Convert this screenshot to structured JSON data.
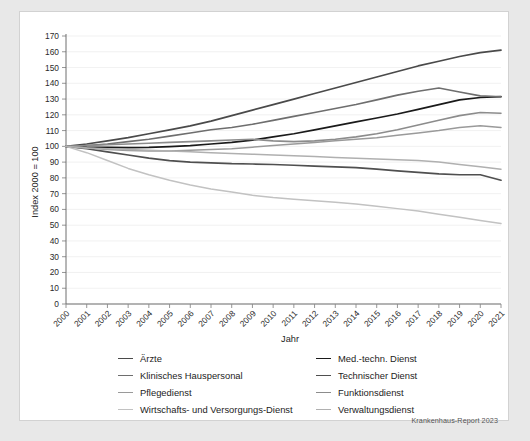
{
  "figure": {
    "credit": "Krankenhaus-Report 2023"
  },
  "chart_data": {
    "type": "line",
    "title": "",
    "xlabel": "Jahr",
    "ylabel": "Index 2000 = 100",
    "xlim": [
      2000,
      2021
    ],
    "ylim": [
      0,
      170
    ],
    "ytick_step": 10,
    "grid": true,
    "legend_position": "bottom",
    "x": [
      2000,
      2001,
      2002,
      2003,
      2004,
      2005,
      2006,
      2007,
      2008,
      2009,
      2010,
      2011,
      2012,
      2013,
      2014,
      2015,
      2016,
      2017,
      2018,
      2019,
      2020,
      2021
    ],
    "xticklabels": [
      "2000",
      "2001",
      "2002",
      "2003",
      "2004",
      "2005",
      "2006",
      "2007",
      "2008",
      "2009",
      "2010",
      "2011",
      "2012",
      "2013",
      "2014",
      "2015",
      "2016",
      "2017",
      "2018",
      "2019",
      "2020",
      "2021"
    ],
    "yticklabels": [
      "0",
      "10",
      "20",
      "30",
      "40",
      "50",
      "60",
      "70",
      "80",
      "90",
      "100",
      "110",
      "120",
      "130",
      "140",
      "150",
      "160",
      "170"
    ],
    "series": [
      {
        "name": "Ärzte",
        "color": "#4a4a4a",
        "width": 1.7,
        "values": [
          100,
          101.5,
          103.5,
          105.5,
          108,
          110.5,
          113,
          116,
          119.5,
          123,
          126.5,
          130,
          133.5,
          137,
          140.5,
          144,
          147.5,
          151,
          154,
          157,
          159.5,
          161
        ]
      },
      {
        "name": "Med.-techn. Dienst",
        "color": "#1a1a1a",
        "width": 1.7,
        "values": [
          100,
          99.5,
          99.3,
          99.2,
          99.3,
          99.8,
          100.5,
          101.5,
          102.5,
          104,
          106,
          108,
          110.5,
          113,
          115.5,
          118,
          120.5,
          123.5,
          126.5,
          129.5,
          131,
          131.5
        ]
      },
      {
        "name": "Klinisches Hauspersonal",
        "color": "#6e6e6e",
        "width": 1.6,
        "values": [
          100,
          100.5,
          101.5,
          103,
          104.5,
          106.5,
          108.5,
          110.5,
          112,
          114,
          116.5,
          119,
          121.5,
          124,
          126.5,
          129.5,
          132.5,
          135,
          137,
          134.5,
          132,
          131.5
        ]
      },
      {
        "name": "Technischer Dienst",
        "color": "#4f4f4f",
        "width": 1.7,
        "values": [
          100,
          98.5,
          96.5,
          94.5,
          92.5,
          91,
          90,
          89.5,
          89,
          88.8,
          88.5,
          88,
          87.5,
          87,
          86.5,
          85.5,
          84.5,
          83.5,
          82.5,
          82,
          82,
          78.5
        ]
      },
      {
        "name": "Pflegedienst",
        "color": "#9a9a9a",
        "width": 1.5,
        "values": [
          100,
          99,
          98,
          97.3,
          97,
          97,
          97.5,
          98,
          98.5,
          99.5,
          100.5,
          101.5,
          102.5,
          103.5,
          104.5,
          105.5,
          107,
          108.5,
          110,
          112,
          113,
          112
        ]
      },
      {
        "name": "Funktionsdienst",
        "color": "#8c8c8c",
        "width": 1.6,
        "values": [
          100,
          100.5,
          101,
          101.5,
          102,
          102.5,
          103,
          103.5,
          104,
          104.5,
          103.5,
          103,
          103.5,
          104.5,
          106,
          108,
          110.5,
          113.5,
          116.5,
          119.5,
          121.5,
          121
        ]
      },
      {
        "name": "Wirtschafts- und Versorgungs-Dienst",
        "color": "#c2c2c2",
        "width": 1.5,
        "values": [
          100,
          96,
          91,
          86,
          82,
          78.5,
          75.5,
          73,
          71,
          69,
          67.5,
          66.5,
          65.5,
          64.5,
          63.5,
          62,
          60.5,
          59,
          57,
          55,
          53,
          51
        ]
      },
      {
        "name": "Verwaltungsdienst",
        "color": "#b0b0b0",
        "width": 1.5,
        "values": [
          100,
          99,
          98.5,
          98,
          97.5,
          97,
          96.5,
          96,
          95.5,
          95,
          94.5,
          94,
          93.5,
          93,
          92.5,
          92,
          91.5,
          91,
          90,
          88.5,
          87,
          85.5
        ]
      }
    ],
    "legend_columns": [
      [
        "Ärzte",
        "Klinisches Hauspersonal",
        "Pflegedienst",
        "Wirtschafts- und Versorgungs-Dienst"
      ],
      [
        "Med.-techn. Dienst",
        "Technischer Dienst",
        "Funktionsdienst",
        "Verwaltungsdienst"
      ]
    ]
  }
}
